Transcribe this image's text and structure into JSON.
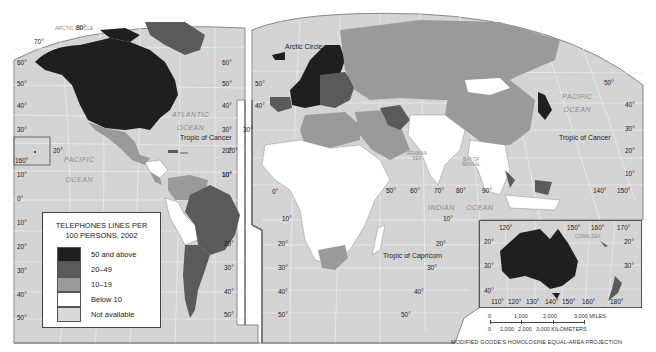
{
  "map": {
    "title": "Telephone lines per 100 persons, 2002",
    "projection": "MODIFIED GOODE'S HOMOLOSINE EQUAL-AREA PROJECTION",
    "colors": {
      "ocean": "#d4d4d4",
      "graticule": "#ededed",
      "border": "#555555",
      "background": "#ffffff"
    }
  },
  "legend": {
    "title_line1": "TELEPHONES LINES PER",
    "title_line2": "100 PERSONS, 2002",
    "items": [
      {
        "label": "50 and above",
        "color": "#1f1f1f"
      },
      {
        "label": "20–49",
        "color": "#5a5a5a"
      },
      {
        "label": "10–19",
        "color": "#9a9a9a"
      },
      {
        "label": "Below 10",
        "color": "#ffffff"
      },
      {
        "label": "Not available",
        "color": "#d9d9d9"
      }
    ]
  },
  "labels": {
    "arctic_circle": "Arctic Circle",
    "arctic_circle_faint_left": "ARCTIC CIRCLE",
    "tropic_cancer": "Tropic of Cancer",
    "tropic_capricorn": "Tropic of Capricorn",
    "atlantic_ocean_1": "ATLANTIC",
    "atlantic_ocean_2": "OCEAN",
    "pacific_ocean_left_1": "PACIFIC",
    "pacific_ocean_left_2": "OCEAN",
    "pacific_ocean_right_1": "PACIFIC",
    "pacific_ocean_right_2": "OCEAN",
    "indian_ocean_1": "INDIAN",
    "indian_ocean_2": "OCEAN",
    "arabian_sea_1": "ARABIAN",
    "arabian_sea_2": "SEA",
    "bay_bengal_1": "BAY OF",
    "bay_bengal_2": "BENGAL",
    "coral_sea": "CORAL SEA"
  },
  "graticule": {
    "left_lat": [
      "70°",
      "60°",
      "50°",
      "40°",
      "30°",
      "20°",
      "10°",
      "0°",
      "10°",
      "20°",
      "30°",
      "40°",
      "50°"
    ],
    "top_80": "80°",
    "hawaii_lon": "160°",
    "hawaii_lat": "20°",
    "mid_left_lat": [
      "60°",
      "50°",
      "40°",
      "30°",
      "20°",
      "10°",
      "20°",
      "30°",
      "40°",
      "50°"
    ],
    "mid_right_lat": [
      "50°",
      "40°",
      "30°",
      "20°",
      "10°",
      "0°",
      "10°",
      "20°",
      "30°",
      "40°",
      "50°"
    ],
    "africa_lon": [
      "50°",
      "60°",
      "70°",
      "80°",
      "90°"
    ],
    "indian_lat": [
      "10°",
      "20°",
      "30°",
      "40°",
      "50°"
    ],
    "right_lat": [
      "50°",
      "40°",
      "30°",
      "20°",
      "10°"
    ],
    "right_lon": [
      "140°",
      "150°"
    ],
    "inset_top_lon": [
      "120°",
      "150°",
      "160°",
      "170°"
    ],
    "inset_bottom_lon": [
      "110°",
      "120°",
      "130°",
      "140°",
      "150°",
      "160°",
      "180°"
    ],
    "inset_left_lat": [
      "20°",
      "30°",
      "40°"
    ],
    "inset_right_lat": [
      "20°",
      "30°"
    ]
  },
  "scale": {
    "miles": [
      "0",
      "1,000",
      "2,000",
      "3,000 MILES"
    ],
    "km": [
      "0",
      "1,000",
      "2,000",
      "3,000 KILOMETERS"
    ]
  }
}
